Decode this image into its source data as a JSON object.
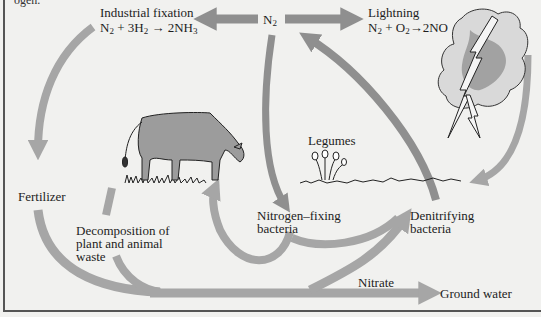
{
  "figure": {
    "title_fragment": "ogen.",
    "colors": {
      "arrow": "#a6a6a6",
      "arrow_dark": "#8f8f8f",
      "background": "#f1f1ef",
      "text": "#1d1d1d",
      "frame": "#555555"
    }
  },
  "nodes": {
    "n2": {
      "label": "N",
      "sub": "2"
    },
    "industrial_fixation": {
      "title": "Industrial fixation",
      "equation": {
        "a": "N",
        "a_sub": "2",
        "b": " + 3H",
        "b_sub": "2",
        "c": " → 2NH",
        "c_sub": "3"
      }
    },
    "lightning": {
      "title": "Lightning",
      "equation": {
        "a": "N",
        "a_sub": "2",
        "b": " + O",
        "b_sub": "2",
        "c": "→2NO"
      }
    },
    "fertilizer": "Fertilizer",
    "legumes": "Legumes",
    "decomposition": {
      "line1": "Decomposition of",
      "line2": "plant and animal",
      "line3": "waste"
    },
    "nitrogen_fixing": {
      "line1": "Nitrogen–fixing",
      "line2": "bacteria"
    },
    "denitrifying": {
      "line1": "Denitrifying",
      "line2": "bacteria"
    },
    "nitrate": "Nitrate",
    "ground_water": "Ground water"
  },
  "illustrations": [
    "cow-grazing",
    "legume-plants",
    "storm-cloud-with-lightning",
    "grass-ground-line"
  ]
}
